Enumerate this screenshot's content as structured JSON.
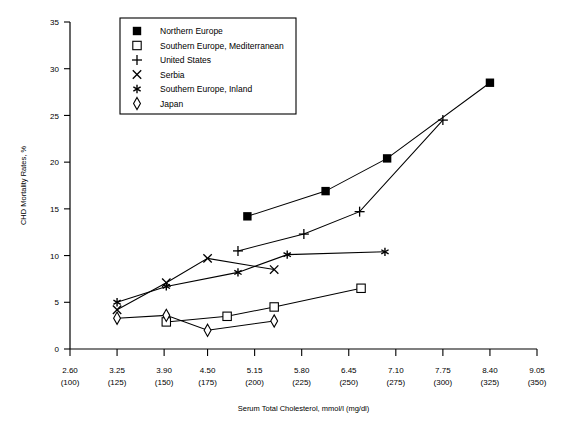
{
  "chart_data": {
    "type": "line",
    "title": "",
    "xlabel": "Serum Total Cholesterol, mmol/l (mg/dl)",
    "ylabel": "CHD Mortality Rates, %",
    "xlim": [
      2.6,
      9.05
    ],
    "ylim": [
      0,
      35
    ],
    "grid": false,
    "legend_position": "top-center",
    "x_ticks": [
      {
        "primary": "2.60",
        "secondary": "(100)",
        "value": 2.6
      },
      {
        "primary": "3.25",
        "secondary": "(125)",
        "value": 3.25
      },
      {
        "primary": "3.90",
        "secondary": "(150)",
        "value": 3.9
      },
      {
        "primary": "4.50",
        "secondary": "(175)",
        "value": 4.5
      },
      {
        "primary": "5.15",
        "secondary": "(200)",
        "value": 5.15
      },
      {
        "primary": "5.80",
        "secondary": "(225)",
        "value": 5.8
      },
      {
        "primary": "6.45",
        "secondary": "(250)",
        "value": 6.45
      },
      {
        "primary": "7.10",
        "secondary": "(275)",
        "value": 7.1
      },
      {
        "primary": "7.75",
        "secondary": "(300)",
        "value": 7.75
      },
      {
        "primary": "8.40",
        "secondary": "(325)",
        "value": 8.4
      },
      {
        "primary": "9.05",
        "secondary": "(350)",
        "value": 9.05
      }
    ],
    "y_ticks": [
      0,
      5,
      10,
      15,
      20,
      25,
      30,
      35
    ],
    "series": [
      {
        "name": "Northern Europe",
        "marker": "filled-square",
        "x": [
          5.05,
          6.13,
          6.98,
          8.4
        ],
        "y": [
          14.2,
          16.9,
          20.4,
          28.5
        ]
      },
      {
        "name": "Southern Europe, Mediterranean",
        "marker": "open-square",
        "x": [
          3.93,
          4.77,
          5.42,
          6.62
        ],
        "y": [
          2.9,
          3.5,
          4.5,
          6.5
        ]
      },
      {
        "name": "United States",
        "marker": "plus",
        "x": [
          4.92,
          5.83,
          6.6,
          7.75
        ],
        "y": [
          10.5,
          12.3,
          14.7,
          24.5
        ]
      },
      {
        "name": "Serbia",
        "marker": "cross",
        "x": [
          3.25,
          3.93,
          4.5,
          5.42
        ],
        "y": [
          4.2,
          7.1,
          9.7,
          8.5
        ]
      },
      {
        "name": "Southern Europe, Inland",
        "marker": "asterisk",
        "x": [
          3.25,
          3.93,
          4.92,
          5.6,
          6.95
        ],
        "y": [
          5.0,
          6.7,
          8.2,
          10.1,
          10.4
        ]
      },
      {
        "name": "Japan",
        "marker": "diamond",
        "x": [
          3.25,
          3.93,
          4.5,
          5.42
        ],
        "y": [
          3.3,
          3.6,
          2.0,
          3.0
        ]
      }
    ]
  },
  "legend": {
    "items": [
      {
        "label": "Northern Europe",
        "marker": "filled-square"
      },
      {
        "label": "Southern Europe, Mediterranean",
        "marker": "open-square"
      },
      {
        "label": "United States",
        "marker": "plus"
      },
      {
        "label": "Serbia",
        "marker": "cross"
      },
      {
        "label": "Southern Europe, Inland",
        "marker": "asterisk"
      },
      {
        "label": "Japan",
        "marker": "diamond"
      }
    ]
  },
  "colors": {
    "axis": "#000000",
    "series": "#000000",
    "background": "#ffffff"
  }
}
